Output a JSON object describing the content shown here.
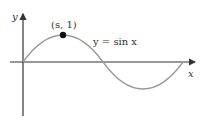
{
  "diagram": {
    "title": "",
    "axes": {
      "x_label": "x",
      "y_label": "y",
      "color": "#333333"
    },
    "curve": {
      "equation_label": "y = sin x",
      "function": "sin",
      "domain": [
        "0",
        "2π"
      ],
      "color": "#9a9a9a"
    },
    "point": {
      "label": "(s, 1)",
      "color": "#111111"
    }
  }
}
